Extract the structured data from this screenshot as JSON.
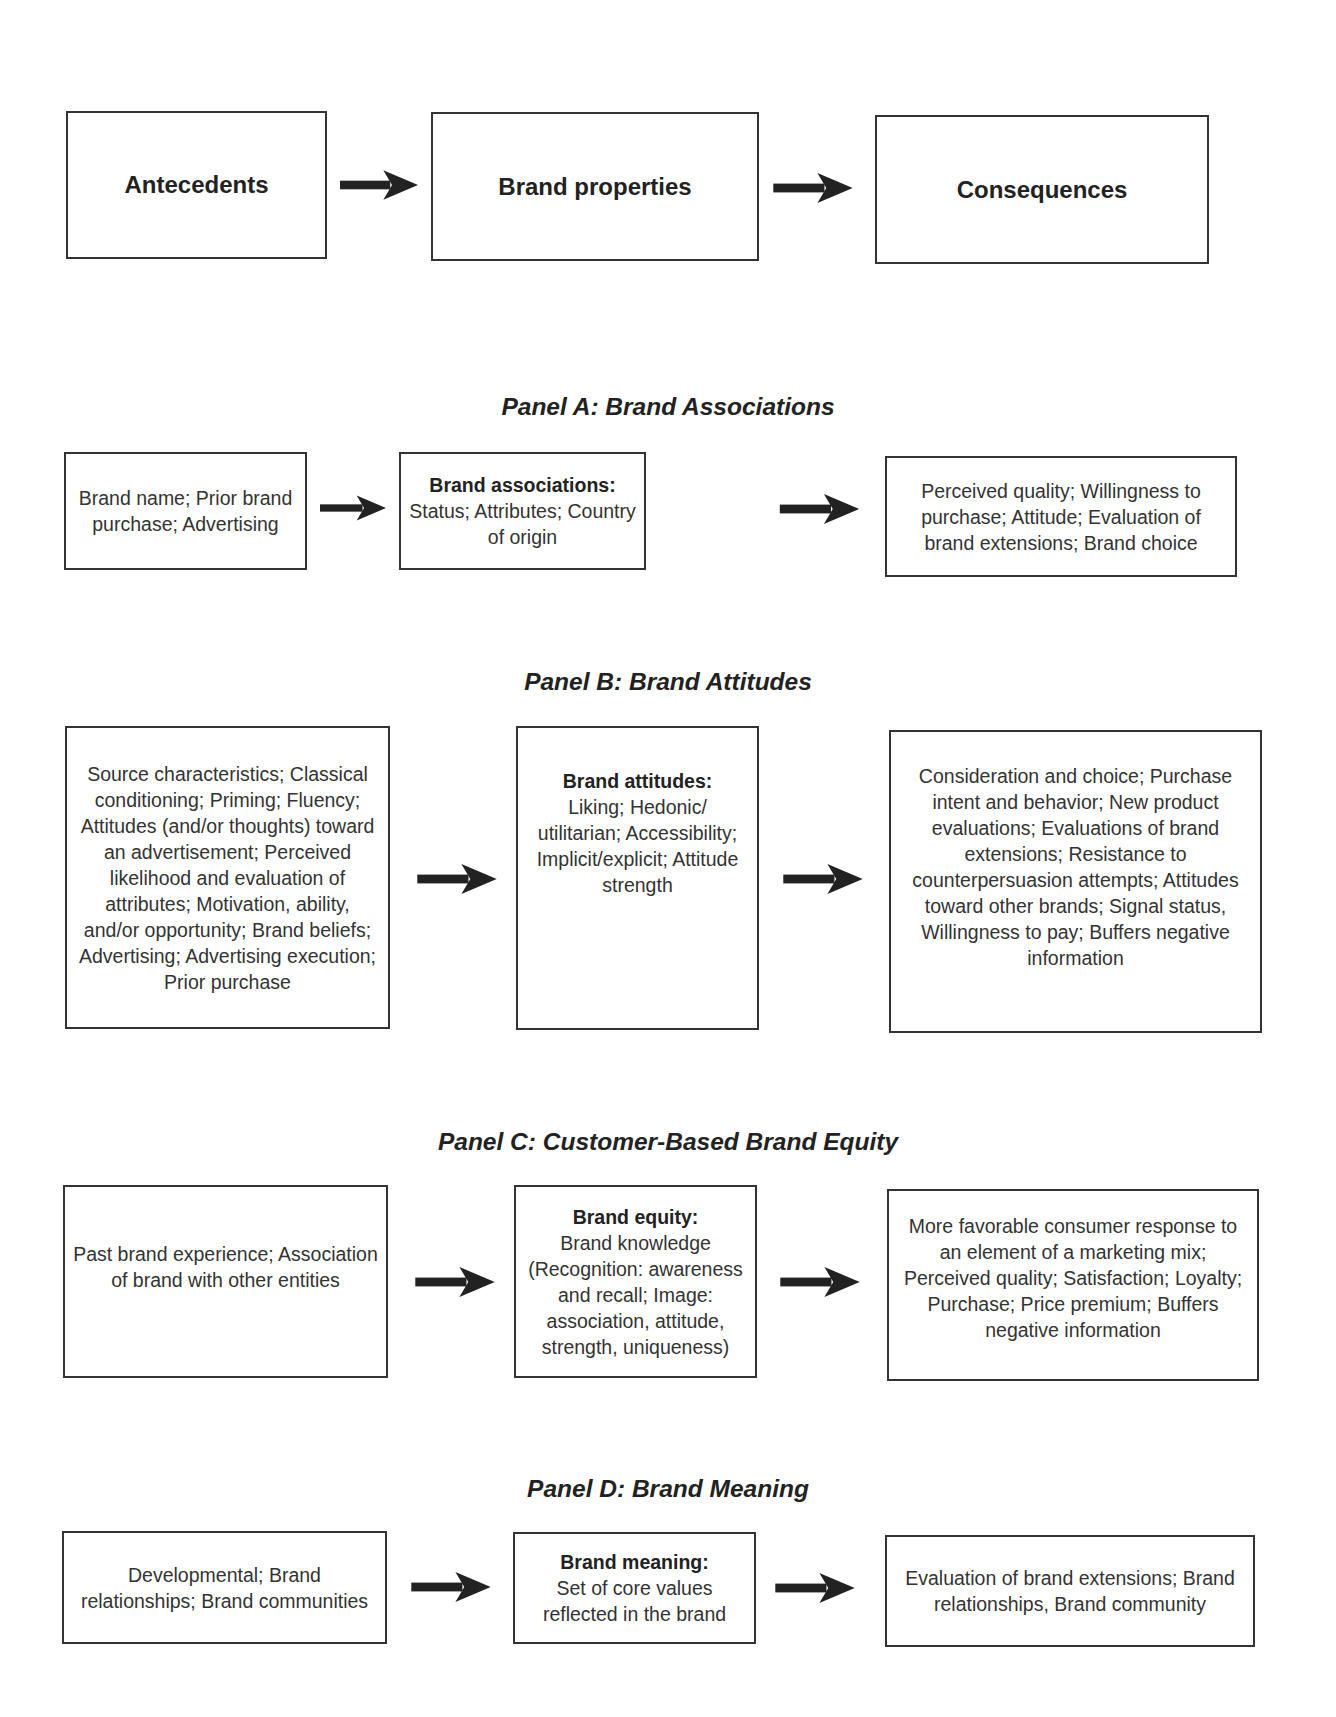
{
  "header_row": {
    "antecedents": "Antecedents",
    "brand_properties": "Brand properties",
    "consequences": "Consequences"
  },
  "panels": [
    {
      "title": "Panel A: Brand Associations",
      "antecedents": "Brand name; Prior brand purchase; Advertising",
      "property_label": "Brand associations:",
      "property_text": "Status; Attributes; Country of origin",
      "consequences": "Perceived quality; Willingness to purchase; Attitude; Evaluation of brand extensions; Brand choice"
    },
    {
      "title": "Panel B: Brand Attitudes",
      "antecedents": "Source characteristics; Classical conditioning; Priming; Fluency; Attitudes (and/or thoughts) toward an advertisement; Perceived likelihood and evaluation of attributes; Motivation, ability, and/or opportunity; Brand beliefs; Advertising; Advertising execution; Prior purchase",
      "property_label": "Brand attitudes:",
      "property_text": "Liking; Hedonic/ utilitarian; Accessibility; Implicit/explicit; Attitude strength",
      "consequences": "Consideration and choice; Purchase intent and behavior; New product evaluations; Evaluations of brand extensions; Resistance to counterpersuasion attempts; Attitudes toward other brands; Signal status, Willingness to pay; Buffers negative information"
    },
    {
      "title": "Panel C: Customer-Based Brand Equity",
      "antecedents": "Past brand experience; Association of brand with other entities",
      "property_label": "Brand equity:",
      "property_text": "Brand knowledge (Recognition: awareness and recall; Image: association, attitude, strength, uniqueness)",
      "consequences": "More favorable consumer response to an element of a marketing mix; Perceived quality; Satisfaction; Loyalty; Purchase; Price premium; Buffers negative information"
    },
    {
      "title": "Panel D: Brand Meaning",
      "antecedents": "Developmental; Brand relationships; Brand communities",
      "property_label": "Brand meaning:",
      "property_text": "Set of core values reflected in the brand",
      "consequences": "Evaluation of brand extensions; Brand relationships, Brand community"
    }
  ],
  "colors": {
    "border": "#333333",
    "arrow": "#222222",
    "text": "#2a2a2a",
    "background": "#ffffff"
  }
}
